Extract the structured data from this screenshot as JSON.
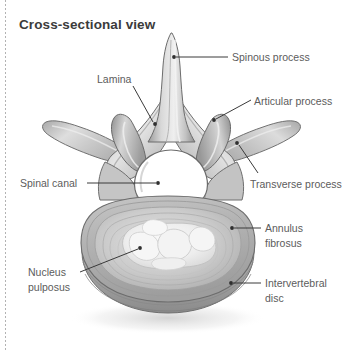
{
  "figure": {
    "title": "Cross-sectional view",
    "background_color": "#ffffff",
    "title_color": "#3b3b3b",
    "label_color": "#5c5c5c",
    "leader_color": "#3a3a3a",
    "left_rule": {
      "style": "dotted",
      "color": "#9a9a9a",
      "x": 5
    }
  },
  "labels": {
    "spinous_process": {
      "lines": [
        "Spinous process"
      ],
      "x": 232,
      "y": 50,
      "side": "right"
    },
    "articular_process": {
      "lines": [
        "Articular process"
      ],
      "x": 254,
      "y": 94,
      "side": "right"
    },
    "transverse_process": {
      "lines": [
        "Transverse process"
      ],
      "x": 250,
      "y": 177,
      "side": "right"
    },
    "annulus_fibrosus": {
      "lines": [
        "Annulus",
        "fibrosus"
      ],
      "x": 265,
      "y": 221,
      "side": "right"
    },
    "intervertebral_disc": {
      "lines": [
        "Intervertebral",
        "disc"
      ],
      "x": 265,
      "y": 276,
      "side": "right"
    },
    "lamina": {
      "lines": [
        "Lamina"
      ],
      "x": 97,
      "y": 72,
      "side": "left"
    },
    "spinal_canal": {
      "lines": [
        "Spinal canal"
      ],
      "x": 20,
      "y": 176,
      "side": "left"
    },
    "nucleus_pulposus": {
      "lines": [
        "Nucleus",
        "pulposus"
      ],
      "x": 28,
      "y": 265,
      "side": "left"
    }
  },
  "leaders": [
    {
      "name": "spinous-process-leader",
      "from": [
        228,
        57
      ],
      "to": [
        174,
        57
      ],
      "dot": [
        174,
        57
      ]
    },
    {
      "name": "articular-process-leader",
      "from": [
        251,
        101
      ],
      "to": [
        214,
        120
      ],
      "dot": [
        214,
        120
      ]
    },
    {
      "name": "transverse-process-leader",
      "from": [
        257,
        174
      ],
      "to": [
        237,
        143
      ],
      "dot": [
        237,
        143
      ]
    },
    {
      "name": "annulus-fibrosus-leader",
      "from": [
        261,
        228
      ],
      "to": [
        232,
        228
      ],
      "dot": [
        232,
        228
      ]
    },
    {
      "name": "intervertebral-disc-leader",
      "from": [
        261,
        283
      ],
      "to": [
        231,
        283
      ],
      "dot": [
        231,
        283
      ]
    },
    {
      "name": "lamina-leader",
      "from": [
        133,
        86
      ],
      "to": [
        155,
        124
      ],
      "dot": [
        155,
        124
      ]
    },
    {
      "name": "spinal-canal-leader",
      "from": [
        87,
        183
      ],
      "to": [
        158,
        183
      ],
      "dot": [
        158,
        183
      ]
    },
    {
      "name": "nucleus-pulposus-leader",
      "from": [
        80,
        272
      ],
      "to": [
        140,
        248
      ],
      "dot": [
        140,
        248
      ]
    }
  ],
  "anatomy_parts": [
    "spinous-process",
    "left-lamina",
    "right-lamina",
    "left-superior-articular-process",
    "right-superior-articular-process",
    "left-transverse-process",
    "right-transverse-process",
    "vertebral-foramen-spinal-canal",
    "intervertebral-disc-body",
    "annulus-fibrosus-rings",
    "nucleus-pulposus"
  ],
  "palette": {
    "bone_light": "#e9e9e9",
    "bone_mid": "#c9c9c9",
    "bone_dark": "#9e9e9e",
    "bone_outline": "#6f6f6f",
    "disc_outer": "#b4b4b4",
    "disc_ring": "#c4c4c4",
    "disc_inner": "#dcdcdc",
    "nucleus": "#f1f1f1",
    "canal_fill": "#ffffff",
    "shadow": "#d6d6d6"
  }
}
